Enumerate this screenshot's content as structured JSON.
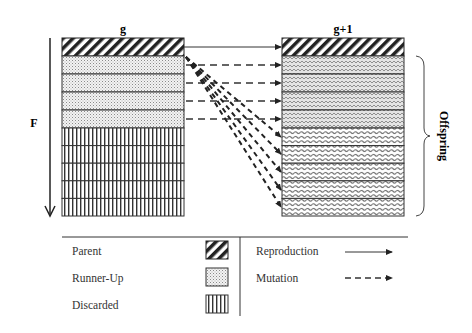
{
  "diagram": {
    "generation_left_label": "g",
    "generation_right_label": "g+1",
    "fitness_axis_label": "F",
    "offspring_label": "Offspring",
    "left_column": {
      "rows": [
        "parent",
        "runner-up",
        "runner-up",
        "runner-up",
        "runner-up",
        "discarded",
        "discarded",
        "discarded",
        "discarded",
        "discarded"
      ]
    },
    "right_column": {
      "rows": [
        "parent",
        "mutated",
        "mutated",
        "mutated",
        "mutated",
        "offspring",
        "offspring",
        "offspring",
        "offspring",
        "offspring"
      ]
    },
    "arrows": [
      {
        "from": "g.row1",
        "to": "g+1.row1",
        "type": "reproduction"
      },
      {
        "from": "g.row2",
        "to": "g+1.row2",
        "type": "mutation"
      },
      {
        "from": "g.row3",
        "to": "g+1.row3",
        "type": "mutation"
      },
      {
        "from": "g.row4",
        "to": "g+1.row4",
        "type": "mutation"
      },
      {
        "from": "g.row5",
        "to": "g+1.row5",
        "type": "mutation"
      },
      {
        "from": "g.row1",
        "to": "g+1.row6",
        "type": "mutation"
      },
      {
        "from": "g.row1",
        "to": "g+1.row7",
        "type": "mutation"
      },
      {
        "from": "g.row1",
        "to": "g+1.row8",
        "type": "mutation"
      },
      {
        "from": "g.row1",
        "to": "g+1.row9",
        "type": "mutation"
      },
      {
        "from": "g.row1",
        "to": "g+1.row10",
        "type": "mutation"
      }
    ]
  },
  "legend": {
    "items": [
      {
        "label": "Parent",
        "swatch": "diagonal-hatch"
      },
      {
        "label": "Runner-Up",
        "swatch": "dotted"
      },
      {
        "label": "Discarded",
        "swatch": "vertical-lines"
      }
    ],
    "arrows": [
      {
        "label": "Reproduction",
        "style": "solid"
      },
      {
        "label": "Mutation",
        "style": "dashed"
      }
    ]
  },
  "colors": {
    "ink": "#222222",
    "background": "#ffffff",
    "dots": "#9a9a9a"
  }
}
